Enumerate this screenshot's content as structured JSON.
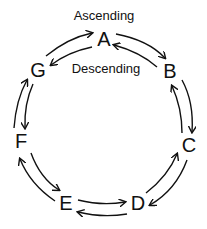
{
  "labels": {
    "outer": "Ascending",
    "inner": "Descending"
  },
  "nodes": [
    {
      "id": "A",
      "label": "A"
    },
    {
      "id": "B",
      "label": "B"
    },
    {
      "id": "C",
      "label": "C"
    },
    {
      "id": "D",
      "label": "D"
    },
    {
      "id": "E",
      "label": "E"
    },
    {
      "id": "F",
      "label": "F"
    },
    {
      "id": "G",
      "label": "G"
    }
  ],
  "edges": {
    "outer_clockwise": [
      "G→A",
      "A→B",
      "B→C",
      "C→D",
      "D→E",
      "E→F",
      "F→G"
    ],
    "inner_counterclockwise": [
      "A→G",
      "B→A",
      "C→B",
      "D→C",
      "E→D",
      "F→E",
      "G→F"
    ]
  }
}
